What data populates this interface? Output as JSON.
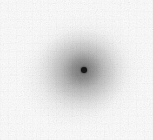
{
  "image": {
    "kind": "grayscale-radial-source",
    "description": "Diffuse radially symmetric gray halo with a small black point source near the center",
    "width_px": 153,
    "height_px": 140,
    "background_color": "#ffffff",
    "colormap": "grayscale"
  },
  "chart_data": {
    "type": "heatmap",
    "title": "",
    "subtitle": "",
    "xlabel": "",
    "ylabel": "",
    "grid": false,
    "legend": "none",
    "colorbar": false,
    "axis_ticks": [],
    "annotations": [],
    "xlim": [
      0,
      153
    ],
    "ylim": [
      0,
      140
    ],
    "colormap": "gray_reversed",
    "value_range": [
      0,
      1
    ],
    "features": [
      {
        "name": "point-source",
        "shape": "dot",
        "center_x": 84,
        "center_y": 70,
        "radius_px": 3,
        "color": "#0b0b0b",
        "intensity": 1.0
      },
      {
        "name": "inner-core-halo",
        "shape": "radial-gradient",
        "center_x": 83,
        "center_y": 70,
        "radius_px": 20,
        "color": "#4e4e4e",
        "intensity": 0.62
      },
      {
        "name": "mid-halo",
        "shape": "radial-gradient",
        "center_x": 83,
        "center_y": 70,
        "radius_px": 44,
        "color": "#8a8a8a",
        "intensity": 0.38
      },
      {
        "name": "outer-halo",
        "shape": "radial-gradient",
        "center_x": 83,
        "center_y": 70,
        "radius_px": 72,
        "color": "#d2d2d2",
        "intensity": 0.14
      },
      {
        "name": "background-field",
        "shape": "uniform",
        "color": "#ffffff",
        "intensity": 0.0
      }
    ],
    "radial_profile": {
      "radius_px": [
        0,
        3,
        8,
        16,
        24,
        34,
        45,
        56,
        68,
        80
      ],
      "gray_level": [
        11,
        40,
        96,
        118,
        136,
        162,
        192,
        219,
        240,
        253
      ],
      "note": "Gray level 0 = black, 255 = white; sampled outward from the point source"
    },
    "noise": {
      "present": true,
      "type": "pixel-grain",
      "amplitude": 0.06
    }
  }
}
